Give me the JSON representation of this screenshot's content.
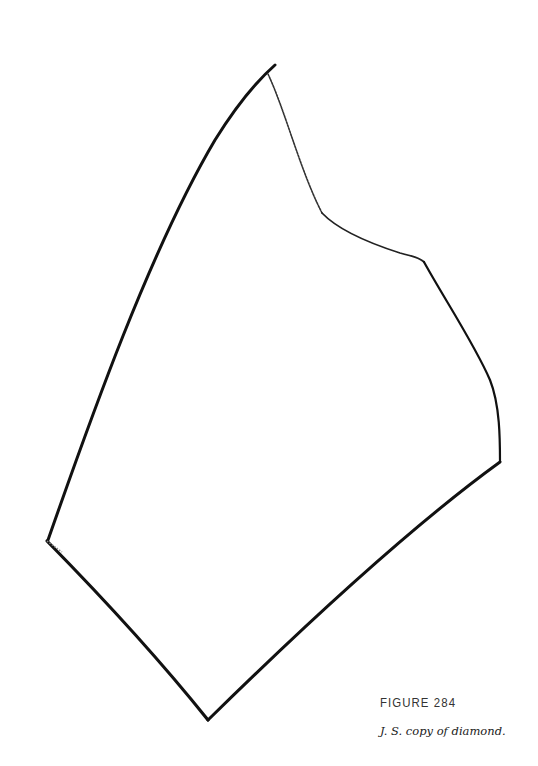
{
  "figure": {
    "label": "FIGURE 284",
    "caption": "J. S. copy of diamond."
  },
  "drawing": {
    "description": "Hand-drawn copy of a diamond shape with uneven strokes",
    "stroke_color": "#111111",
    "vertices": [
      {
        "name": "top",
        "x": 270,
        "y": 70
      },
      {
        "name": "upper-right-notch",
        "x": 322,
        "y": 215
      },
      {
        "name": "right-shoulder",
        "x": 425,
        "y": 263
      },
      {
        "name": "right",
        "x": 500,
        "y": 462
      },
      {
        "name": "bottom",
        "x": 208,
        "y": 720
      },
      {
        "name": "left",
        "x": 47,
        "y": 541
      }
    ]
  }
}
